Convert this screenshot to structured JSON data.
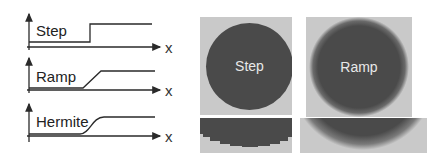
{
  "graphs": [
    {
      "label": "Step",
      "axis_label": "x",
      "profile": "step"
    },
    {
      "label": "Ramp",
      "axis_label": "x",
      "profile": "ramp"
    },
    {
      "label": "Hermite",
      "axis_label": "x",
      "profile": "hermite"
    }
  ],
  "panels": [
    {
      "label": "Step",
      "edge": "hard"
    },
    {
      "label": "Ramp",
      "edge": "soft"
    }
  ],
  "colors": {
    "background": "#ffffff",
    "panel_bg": "#c9c9c9",
    "disc": "#4a4a4a",
    "disc_text": "#e8e8e8",
    "line": "#2a2a2a"
  }
}
